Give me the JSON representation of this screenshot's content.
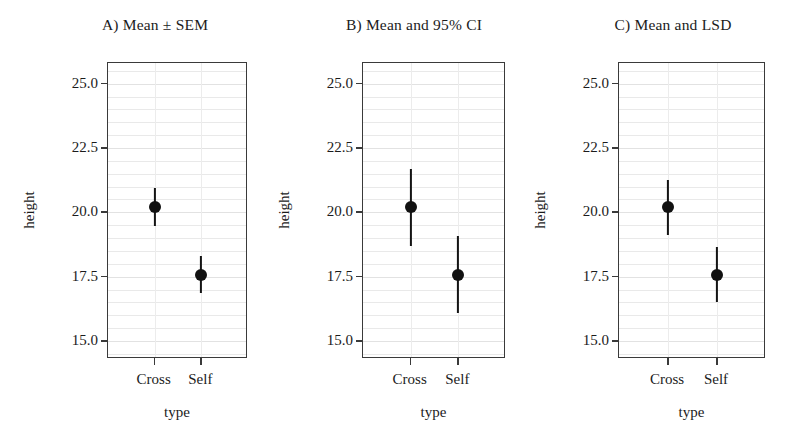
{
  "figure": {
    "width": 792,
    "height": 446,
    "background": "#ffffff",
    "marker_color": "#111111",
    "frame_color": "#3a3a3a",
    "grid_color": "#e9e9e9"
  },
  "axes": {
    "ylabel": "height",
    "xlabel": "type",
    "yticks": [
      "25.0",
      "22.5",
      "20.0",
      "17.5",
      "15.0"
    ],
    "ytick_values": [
      25.0,
      22.5,
      20.0,
      17.5,
      15.0
    ],
    "ylim": [
      14.3,
      25.8
    ],
    "xticks": [
      "Cross",
      "Self"
    ],
    "minor_gridlines": true
  },
  "chart_data": {
    "type": "scatter",
    "xlabel": "type",
    "ylabel": "height",
    "ylim": [
      14.3,
      25.8
    ],
    "yticks": [
      25.0,
      22.5,
      20.0,
      17.5,
      15.0
    ],
    "categories": [
      "Cross",
      "Self"
    ],
    "grid": true,
    "legend": "none",
    "panels": [
      {
        "id": "A",
        "title": "A) Mean ± SEM",
        "interval_type": "SEM",
        "points": [
          {
            "category": "Cross",
            "mean": 20.19,
            "low": 19.45,
            "high": 20.93
          },
          {
            "category": "Self",
            "mean": 17.58,
            "low": 16.85,
            "high": 18.31
          }
        ]
      },
      {
        "id": "B",
        "title": "B) Mean and 95% CI",
        "interval_type": "95% CI",
        "points": [
          {
            "category": "Cross",
            "mean": 20.19,
            "low": 18.68,
            "high": 21.7
          },
          {
            "category": "Self",
            "mean": 17.58,
            "low": 16.07,
            "high": 19.09
          }
        ]
      },
      {
        "id": "C",
        "title": "C) Mean and LSD",
        "interval_type": "LSD",
        "points": [
          {
            "category": "Cross",
            "mean": 20.19,
            "low": 19.13,
            "high": 21.25
          },
          {
            "category": "Self",
            "mean": 17.58,
            "low": 16.52,
            "high": 18.64
          }
        ]
      }
    ]
  }
}
